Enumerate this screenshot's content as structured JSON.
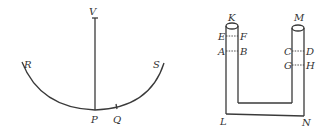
{
  "figures": [
    {
      "id": "pendulum-arc",
      "labels": {
        "V": "V",
        "R": "R",
        "S": "S",
        "P": "P",
        "Q": "Q"
      }
    },
    {
      "id": "u-tube",
      "labels": {
        "K": "K",
        "M": "M",
        "E": "E",
        "F": "F",
        "A": "A",
        "B": "B",
        "C": "C",
        "D": "D",
        "G": "G",
        "H": "H",
        "L": "L",
        "N": "N"
      }
    }
  ],
  "colors": {
    "line": "#3a3a3a",
    "text": "#333333",
    "background": "#ffffff"
  }
}
